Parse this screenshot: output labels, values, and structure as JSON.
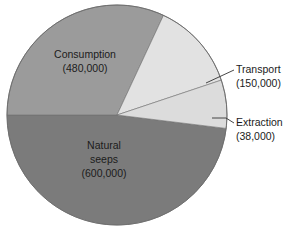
{
  "chart_data": {
    "type": "pie",
    "title": "",
    "subtitle": "",
    "xlabel": "",
    "ylabel": "",
    "units": "tonnes per year",
    "total": 1268000,
    "legend_position": "none",
    "grid": false,
    "categories": [
      "Consumption",
      "Transport",
      "Extraction",
      "Natural seeps"
    ],
    "values": [
      480000,
      150000,
      38000,
      600000
    ],
    "value_labels": [
      "(480,000)",
      "(150,000)",
      "(38,000)",
      "(600,000)"
    ],
    "slices": [
      {
        "name": "Consumption",
        "label_line1": "Consumption",
        "label_line2": "(480,000)",
        "value": 480000,
        "percent": 37.9,
        "color": "#9b9b9b",
        "label_placement": "inside",
        "start_angle_deg": 294.0,
        "end_angle_deg": 430.4
      },
      {
        "name": "Transport",
        "label_line1": "Transport",
        "label_line2": "(150,000)",
        "value": 150000,
        "percent": 11.8,
        "color": "#e2e2e2",
        "label_placement": "callout",
        "start_angle_deg": 251.4,
        "end_angle_deg": 294.0
      },
      {
        "name": "Extraction",
        "label_line1": "Extraction",
        "label_line2": "(38,000)",
        "value": 38000,
        "percent": 3.0,
        "color": "#dcdcdc",
        "label_placement": "callout",
        "start_angle_deg": 240.6,
        "end_angle_deg": 251.4
      },
      {
        "name": "Natural seeps",
        "label_line1": "Natural",
        "label_line2": "seeps",
        "label_line3": "(600,000)",
        "value": 600000,
        "percent": 47.3,
        "color": "#7b7b7b",
        "label_placement": "inside",
        "start_angle_deg": 70.4,
        "end_angle_deg": 240.6
      }
    ],
    "background_color": "#ffffff",
    "outline_color": "#6f6f6f"
  }
}
